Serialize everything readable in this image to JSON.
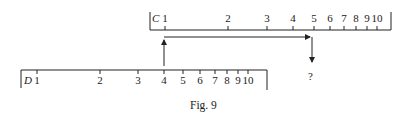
{
  "figure": {
    "caption": "Fig. 9",
    "question_mark": "?"
  },
  "scales": {
    "C": {
      "name": "C",
      "labels": [
        "1",
        "2",
        "3",
        "4",
        "5",
        "6",
        "7",
        "8",
        "9",
        "10"
      ],
      "tick_x": [
        165,
        228,
        267,
        293,
        314,
        330,
        344,
        356,
        367,
        377
      ],
      "baseline_y": 30,
      "left_x": 150,
      "right_x": 391
    },
    "D": {
      "name": "D",
      "labels": [
        "1",
        "2",
        "3",
        "4",
        "5",
        "6",
        "7",
        "8",
        "9",
        "10"
      ],
      "tick_x": [
        37,
        100,
        138,
        164,
        183,
        200,
        215,
        227,
        238,
        248
      ],
      "baseline_y": 70,
      "left_x": 21,
      "right_x": 267
    }
  },
  "arrow": {
    "from_scale": "D",
    "from_value": "4",
    "to_scale": "C",
    "to_value": "5",
    "result": "?"
  }
}
